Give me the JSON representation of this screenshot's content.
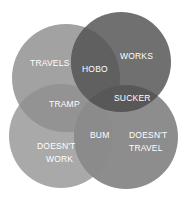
{
  "diagram": {
    "type": "venn",
    "sets": [
      {
        "id": "travels",
        "label": "TRAVELS",
        "color": "#a2a2a2"
      },
      {
        "id": "works",
        "label": "WORKS",
        "color": "#707070"
      },
      {
        "id": "doesnt_work",
        "label_lines": [
          "DOESN'T",
          "WORK"
        ],
        "color": "#a9a9a9"
      },
      {
        "id": "doesnt_travel",
        "label_lines": [
          "DOESN'T",
          "TRAVEL"
        ],
        "color": "#8d8d8d"
      }
    ],
    "intersections": [
      {
        "sets": [
          "travels",
          "works"
        ],
        "label": "HOBO",
        "color": "#5f5f5f"
      },
      {
        "sets": [
          "works",
          "doesnt_travel"
        ],
        "label": "SUCKER",
        "color": "#575757"
      },
      {
        "sets": [
          "travels",
          "doesnt_work"
        ],
        "label": "TRAMP",
        "color": "#929292"
      },
      {
        "sets": [
          "doesnt_work",
          "doesnt_travel"
        ],
        "label": "BUM",
        "color": "#8a8a8a"
      }
    ]
  }
}
